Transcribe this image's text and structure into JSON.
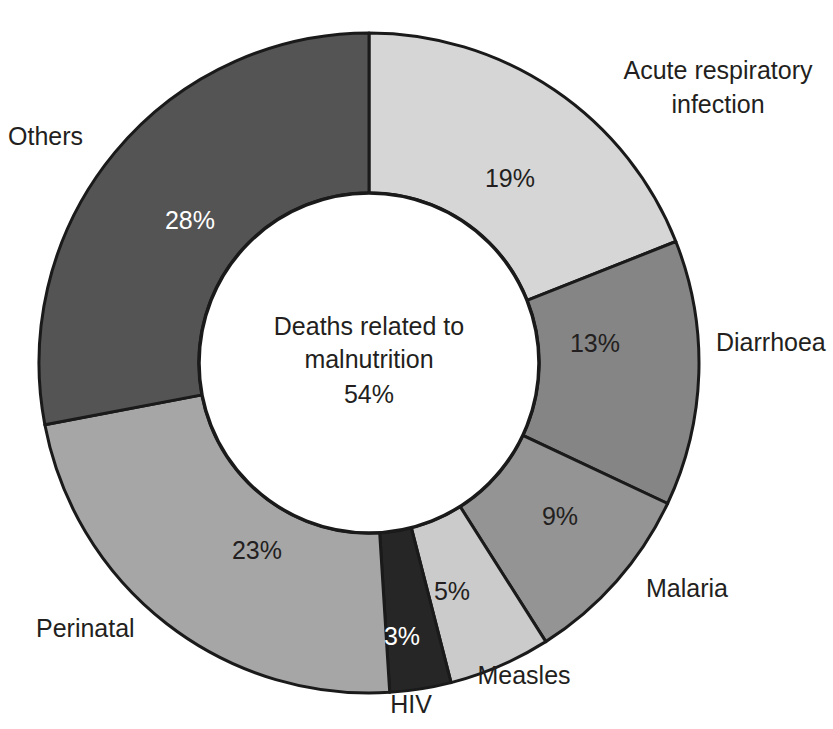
{
  "chart_data": {
    "type": "pie",
    "variant": "donut",
    "title": "",
    "subtitle": "",
    "xlabel": "",
    "ylabel": "",
    "units": "%",
    "legend_position": "outside-labels",
    "grid": false,
    "center_annotation": {
      "line1": "Deaths related to",
      "line2": "malnutrition",
      "line3": "54%",
      "value": 54
    },
    "categories": [
      "Acute respiratory infection",
      "Diarrhoea",
      "Malaria",
      "Measles",
      "HIV",
      "Perinatal",
      "Others"
    ],
    "values": [
      19,
      13,
      9,
      5,
      3,
      23,
      28
    ],
    "slices": [
      {
        "label": "Acute respiratory infection",
        "label_line1": "Acute respiratory",
        "label_line2": "infection",
        "value": 19,
        "value_text": "19%",
        "color": "#d6d6d6",
        "value_text_color": "#231f20",
        "label_x": 718,
        "label_y": 72,
        "label_anchor": "middle",
        "value_x": 510,
        "value_y": 180
      },
      {
        "label": "Diarrhoea",
        "label_line1": "Diarrhoea",
        "label_line2": "",
        "value": 13,
        "value_text": "13%",
        "color": "#858585",
        "value_text_color": "#231f20",
        "label_x": 716,
        "label_y": 344,
        "label_anchor": "start",
        "value_x": 595,
        "value_y": 345
      },
      {
        "label": "Malaria",
        "label_line1": "Malaria",
        "label_line2": "",
        "value": 9,
        "value_text": "9%",
        "color": "#949494",
        "value_text_color": "#231f20",
        "label_x": 646,
        "label_y": 590,
        "label_anchor": "start",
        "value_x": 560,
        "value_y": 518
      },
      {
        "label": "Measles",
        "label_line1": "Measles",
        "label_line2": "",
        "value": 5,
        "value_text": "5%",
        "color": "#cbcbcb",
        "value_text_color": "#231f20",
        "label_x": 524,
        "label_y": 677,
        "label_anchor": "middle",
        "value_x": 452,
        "value_y": 593
      },
      {
        "label": "HIV",
        "label_line1": "HIV",
        "label_line2": "",
        "value": 3,
        "value_text": "3%",
        "color": "#262626",
        "value_text_color": "#ffffff",
        "label_x": 411,
        "label_y": 706,
        "label_anchor": "middle",
        "value_x": 402,
        "value_y": 638
      },
      {
        "label": "Perinatal",
        "label_line1": "Perinatal",
        "label_line2": "",
        "value": 23,
        "value_text": "23%",
        "color": "#a6a6a6",
        "value_text_color": "#231f20",
        "label_x": 36,
        "label_y": 630,
        "label_anchor": "start",
        "value_x": 257,
        "value_y": 552
      },
      {
        "label": "Others",
        "label_line1": "Others",
        "label_line2": "",
        "value": 28,
        "value_text": "28%",
        "color": "#545454",
        "value_text_color": "#ffffff",
        "label_x": 8,
        "label_y": 138,
        "label_anchor": "start",
        "value_x": 190,
        "value_y": 222
      }
    ]
  },
  "geometry": {
    "cx": 369,
    "cy": 363,
    "outer_radius": 330,
    "inner_radius": 170,
    "start_angle_deg": -90
  },
  "colors": {
    "background": "#ffffff",
    "outline": "#1a1a1a",
    "text": "#231f20",
    "text_light": "#ffffff"
  }
}
